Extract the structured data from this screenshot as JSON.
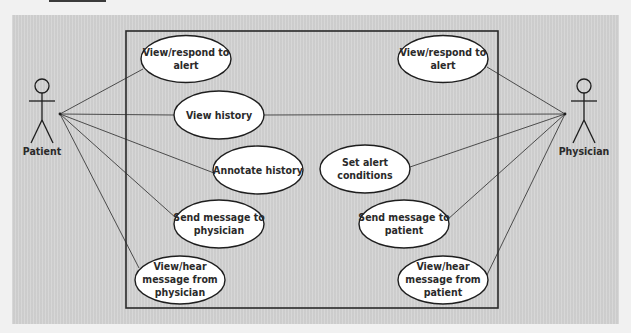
{
  "diagram": {
    "type": "uml-use-case",
    "colors": {
      "page_background": "#f1f1f1",
      "panel_background": "#d3d3d3",
      "use_case_fill": "#ffffff",
      "stroke": "#1e1e1e",
      "text": "#2a2a2a"
    },
    "actors": [
      {
        "id": "patient",
        "label": "Patient"
      },
      {
        "id": "physician",
        "label": "Physician"
      }
    ],
    "use_cases": [
      {
        "id": "p_alert",
        "lines": [
          "View/respond to",
          "alert"
        ]
      },
      {
        "id": "history",
        "lines": [
          "View history"
        ]
      },
      {
        "id": "annotate",
        "lines": [
          "Annotate history"
        ]
      },
      {
        "id": "p_send",
        "lines": [
          "Send message to",
          "physician"
        ]
      },
      {
        "id": "p_hear",
        "lines": [
          "View/hear",
          "message from",
          "physician"
        ]
      },
      {
        "id": "d_alert",
        "lines": [
          "View/respond to",
          "alert"
        ]
      },
      {
        "id": "set_alert",
        "lines": [
          "Set alert",
          "conditions"
        ]
      },
      {
        "id": "d_send",
        "lines": [
          "Send message to",
          "patient"
        ]
      },
      {
        "id": "d_hear",
        "lines": [
          "View/hear",
          "message from",
          "patient"
        ]
      }
    ],
    "associations": [
      {
        "actor": "patient",
        "use_case": "p_alert"
      },
      {
        "actor": "patient",
        "use_case": "history"
      },
      {
        "actor": "patient",
        "use_case": "annotate"
      },
      {
        "actor": "patient",
        "use_case": "p_send"
      },
      {
        "actor": "patient",
        "use_case": "p_hear"
      },
      {
        "actor": "physician",
        "use_case": "history"
      },
      {
        "actor": "physician",
        "use_case": "d_alert"
      },
      {
        "actor": "physician",
        "use_case": "set_alert"
      },
      {
        "actor": "physician",
        "use_case": "d_send"
      },
      {
        "actor": "physician",
        "use_case": "d_hear"
      }
    ]
  }
}
